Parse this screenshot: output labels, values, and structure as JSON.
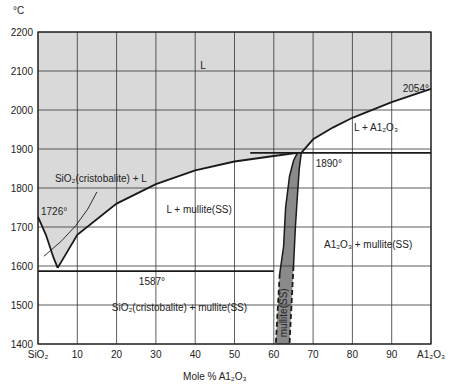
{
  "chart_data": {
    "type": "phase-diagram",
    "title": "",
    "xlabel": "Mole % A1₂O₃",
    "ylabel": "°C",
    "xlim": [
      0,
      100
    ],
    "ylim": [
      1400,
      2200
    ],
    "grid": true,
    "x_ticks": [
      {
        "value": 0,
        "label": "SiO₂"
      },
      {
        "value": 10,
        "label": "10"
      },
      {
        "value": 20,
        "label": "20"
      },
      {
        "value": 30,
        "label": "30"
      },
      {
        "value": 40,
        "label": "40"
      },
      {
        "value": 50,
        "label": "50"
      },
      {
        "value": 60,
        "label": "60"
      },
      {
        "value": 70,
        "label": "70"
      },
      {
        "value": 80,
        "label": "80"
      },
      {
        "value": 90,
        "label": "90"
      },
      {
        "value": 100,
        "label": "A1₂O₃"
      }
    ],
    "y_ticks": [
      1400,
      1500,
      1600,
      1700,
      1800,
      1900,
      2000,
      2100,
      2200
    ],
    "special_points": [
      {
        "label": "1726°",
        "x": 0,
        "y": 1726,
        "desc": "SiO2 melting point"
      },
      {
        "label": "1587°",
        "x": 5,
        "y": 1587,
        "desc": "eutectic"
      },
      {
        "label": "1890°",
        "x": 67,
        "y": 1890,
        "desc": "peritectic"
      },
      {
        "label": "2054°",
        "x": 100,
        "y": 2054,
        "desc": "Al2O3 melting point"
      }
    ],
    "curves": {
      "liquidus_sio2": [
        [
          0,
          1726
        ],
        [
          2,
          1680
        ],
        [
          4,
          1620
        ],
        [
          5,
          1595
        ]
      ],
      "liquidus_mullite": [
        [
          5,
          1595
        ],
        [
          10,
          1680
        ],
        [
          20,
          1760
        ],
        [
          30,
          1810
        ],
        [
          40,
          1845
        ],
        [
          50,
          1868
        ],
        [
          60,
          1882
        ],
        [
          66,
          1890
        ]
      ],
      "liquidus_al2o3": [
        [
          67,
          1890
        ],
        [
          70,
          1925
        ],
        [
          75,
          1955
        ],
        [
          80,
          1980
        ],
        [
          90,
          2020
        ],
        [
          100,
          2054
        ]
      ],
      "eutectic_line": {
        "x": [
          0,
          60
        ],
        "y": 1587
      },
      "peritectic_line": {
        "x": [
          54,
          100
        ],
        "y": 1890
      },
      "mullite_ss_left": [
        [
          66,
          1890
        ],
        [
          65,
          1870
        ],
        [
          64,
          1830
        ],
        [
          63,
          1750
        ],
        [
          62.5,
          1650
        ],
        [
          61.5,
          1580
        ],
        [
          60.5,
          1400
        ]
      ],
      "mullite_ss_right": [
        [
          67,
          1890
        ],
        [
          66.5,
          1850
        ],
        [
          66,
          1780
        ],
        [
          65.5,
          1700
        ],
        [
          65,
          1600
        ],
        [
          64,
          1400
        ]
      ]
    },
    "regions": [
      {
        "label": "L",
        "x": 42,
        "y": 2105
      },
      {
        "label": "L + A1₂O₃",
        "x": 86,
        "y": 1945
      },
      {
        "label": "SiO₂(cristobalite) + L",
        "x": 16,
        "y": 1816
      },
      {
        "label": "L + mullite(SS)",
        "x": 41,
        "y": 1735
      },
      {
        "label": "A1₂O₃ + mullite(SS)",
        "x": 84,
        "y": 1645
      },
      {
        "label": "SiO₂(cristobalite) + mullite(SS)",
        "x": 36,
        "y": 1485
      },
      {
        "label": "mullite(SS)",
        "x": 62.5,
        "y": 1480,
        "rotated": true
      }
    ],
    "colors": {
      "liquid_fill": "#d9d9d9",
      "mullite_fill": "#8a8a8a",
      "line": "#1a1a1a",
      "grid": "#333333"
    }
  }
}
